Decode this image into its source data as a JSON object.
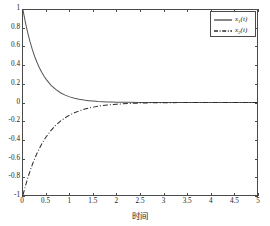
{
  "chart_data": {
    "type": "line",
    "title": "",
    "xlabel": "时间",
    "ylabel": "",
    "xlim": [
      0,
      5
    ],
    "ylim": [
      -1,
      1
    ],
    "grid": false,
    "legend_position": "top-right",
    "xticks": [
      "0",
      "0.5",
      "1",
      "1.5",
      "2",
      "2.5",
      "3",
      "3.5",
      "4",
      "4.5",
      "5"
    ],
    "xtick_values": [
      0,
      0.5,
      1,
      1.5,
      2,
      2.5,
      3,
      3.5,
      4,
      4.5,
      5
    ],
    "yticks": [
      "-1",
      "-0.8",
      "-0.6",
      "-0.4",
      "-0.2",
      "0",
      "0.2",
      "0.4",
      "0.6",
      "0.8",
      "1"
    ],
    "ytick_values": [
      -1,
      -0.8,
      -0.6,
      -0.4,
      -0.2,
      0,
      0.2,
      0.4,
      0.6,
      0.8,
      1
    ],
    "series": [
      {
        "name": "x1(t)",
        "label_base": "x",
        "label_sub": "1",
        "label_arg": "(t)",
        "style": "solid",
        "color": "#555555",
        "x": [
          0,
          0.05,
          0.1,
          0.15,
          0.2,
          0.25,
          0.3,
          0.35,
          0.4,
          0.45,
          0.5,
          0.6,
          0.7,
          0.8,
          0.9,
          1.0,
          1.1,
          1.2,
          1.3,
          1.4,
          1.5,
          1.6,
          1.7,
          1.8,
          1.9,
          2.0,
          2.25,
          2.5,
          2.75,
          3.0,
          3.5,
          4.0,
          4.5,
          5.0
        ],
        "values": [
          1.0,
          0.869,
          0.756,
          0.657,
          0.571,
          0.497,
          0.432,
          0.375,
          0.326,
          0.284,
          0.247,
          0.186,
          0.141,
          0.106,
          0.08,
          0.061,
          0.046,
          0.035,
          0.026,
          0.02,
          0.015,
          0.011,
          0.0085,
          0.0064,
          0.0049,
          0.0037,
          0.0018,
          0.0009,
          0.00045,
          0.00022,
          5e-05,
          1e-05,
          0.0,
          0.0
        ]
      },
      {
        "name": "x2(t)",
        "label_base": "x",
        "label_sub": "2",
        "label_arg": "(t)",
        "style": "dashdot",
        "color": "#2a2a2a",
        "x": [
          0,
          0.05,
          0.1,
          0.15,
          0.2,
          0.25,
          0.3,
          0.35,
          0.4,
          0.45,
          0.5,
          0.6,
          0.7,
          0.8,
          0.9,
          1.0,
          1.1,
          1.2,
          1.3,
          1.4,
          1.5,
          1.6,
          1.7,
          1.8,
          1.9,
          2.0,
          2.25,
          2.5,
          2.75,
          3.0,
          3.5,
          4.0,
          4.5,
          5.0
        ],
        "values": [
          -1.0,
          -0.905,
          -0.819,
          -0.741,
          -0.67,
          -0.607,
          -0.549,
          -0.497,
          -0.449,
          -0.407,
          -0.368,
          -0.301,
          -0.247,
          -0.202,
          -0.165,
          -0.135,
          -0.111,
          -0.091,
          -0.074,
          -0.061,
          -0.05,
          -0.041,
          -0.033,
          -0.027,
          -0.022,
          -0.018,
          -0.0105,
          -0.0062,
          -0.0036,
          -0.0021,
          -0.0007,
          -0.00025,
          -8e-05,
          -3e-05
        ]
      }
    ]
  },
  "figure": {
    "background": "#ffffff",
    "axis_color": "#4a4a4a"
  }
}
